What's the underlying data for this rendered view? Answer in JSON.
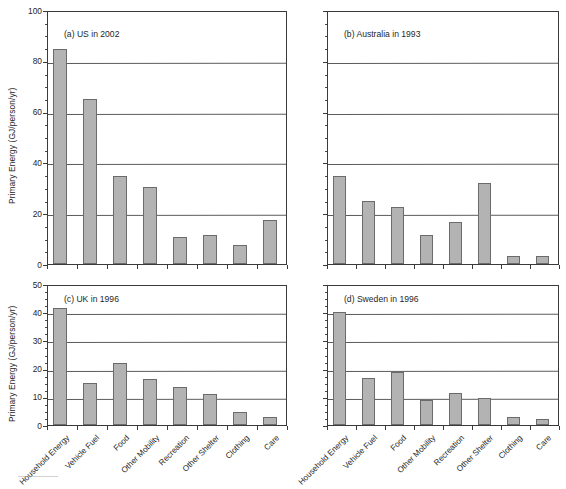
{
  "figure": {
    "categories": [
      "Household Energy",
      "Vehicle Fuel",
      "Food",
      "Other Mobility",
      "Recreation",
      "Other Shelter",
      "Clothing",
      "Care"
    ],
    "y_axis_title": "Primary Energy (GJ/person/yr)",
    "bar_color": "#b3b3b3",
    "bar_edge_color": "#6b6b6b",
    "grid_color": "#5c5c5c",
    "axis_color": "#3a3a3a"
  },
  "panels": [
    {
      "key": "a",
      "caption": "(a)  US in 2002",
      "show_y_labels": true,
      "show_y_title": true,
      "show_x_labels": false,
      "ylim": [
        0,
        100
      ],
      "yticks": [
        0,
        20,
        40,
        60,
        80,
        100
      ],
      "ytick_labels": [
        "0",
        "20",
        "40",
        "60",
        "80",
        "100"
      ],
      "values": [
        84.5,
        65.0,
        34.5,
        30.5,
        10.5,
        11.5,
        7.5,
        17.5
      ]
    },
    {
      "key": "b",
      "caption": "(b)  Australia in 1993",
      "show_y_labels": false,
      "show_y_title": false,
      "show_x_labels": false,
      "ylim": [
        0,
        100
      ],
      "yticks": [
        0,
        20,
        40,
        60,
        80,
        100
      ],
      "ytick_labels": [
        "",
        "",
        "",
        "",
        "",
        ""
      ],
      "values": [
        34.5,
        25.0,
        22.5,
        11.5,
        16.5,
        32.0,
        3.0,
        3.0
      ]
    },
    {
      "key": "c",
      "caption": "(c)  UK in 1996",
      "show_y_labels": true,
      "show_y_title": true,
      "show_x_labels": true,
      "ylim": [
        0,
        50
      ],
      "yticks": [
        0,
        10,
        20,
        30,
        40,
        50
      ],
      "ytick_labels": [
        "0",
        "10",
        "20",
        "30",
        "40",
        "50"
      ],
      "values": [
        41.5,
        15.0,
        22.0,
        16.3,
        13.5,
        11.0,
        4.7,
        3.0
      ]
    },
    {
      "key": "d",
      "caption": "(d)  Sweden in 1996",
      "show_y_labels": false,
      "show_y_title": false,
      "show_x_labels": true,
      "ylim": [
        0,
        50
      ],
      "yticks": [
        0,
        10,
        20,
        30,
        40,
        50
      ],
      "ytick_labels": [
        "",
        "",
        "",
        "",
        "",
        ""
      ],
      "values": [
        40.0,
        16.5,
        18.8,
        9.0,
        11.5,
        9.5,
        3.0,
        2.2
      ]
    }
  ],
  "chart_data": {
    "type": "bar",
    "title": "",
    "subtitle": "",
    "xlabel": "",
    "ylabel": "Primary Energy (GJ/person/yr)",
    "grid": true,
    "legend": "none",
    "layout": "2x2 small multiples",
    "categories": [
      "Household Energy",
      "Vehicle Fuel",
      "Food",
      "Other Mobility",
      "Recreation",
      "Other Shelter",
      "Clothing",
      "Care"
    ],
    "panels": [
      {
        "panel": "a",
        "title": "(a)  US in 2002",
        "ylim": [
          0,
          100
        ],
        "yticks": [
          0,
          20,
          40,
          60,
          80,
          100
        ],
        "values": [
          84.5,
          65.0,
          34.5,
          30.5,
          10.5,
          11.5,
          7.5,
          17.5
        ]
      },
      {
        "panel": "b",
        "title": "(b)  Australia in 1993",
        "ylim": [
          0,
          100
        ],
        "yticks": [
          0,
          20,
          40,
          60,
          80,
          100
        ],
        "values": [
          34.5,
          25.0,
          22.5,
          11.5,
          16.5,
          32.0,
          3.0,
          3.0
        ]
      },
      {
        "panel": "c",
        "title": "(c)  UK in 1996",
        "ylim": [
          0,
          50
        ],
        "yticks": [
          0,
          10,
          20,
          30,
          40,
          50
        ],
        "values": [
          41.5,
          15.0,
          22.0,
          16.3,
          13.5,
          11.0,
          4.7,
          3.0
        ]
      },
      {
        "panel": "d",
        "title": "(d)  Sweden in 1996",
        "ylim": [
          0,
          50
        ],
        "yticks": [
          0,
          10,
          20,
          30,
          40,
          50
        ],
        "values": [
          40.0,
          16.5,
          18.8,
          9.0,
          11.5,
          9.5,
          3.0,
          2.2
        ]
      }
    ]
  }
}
